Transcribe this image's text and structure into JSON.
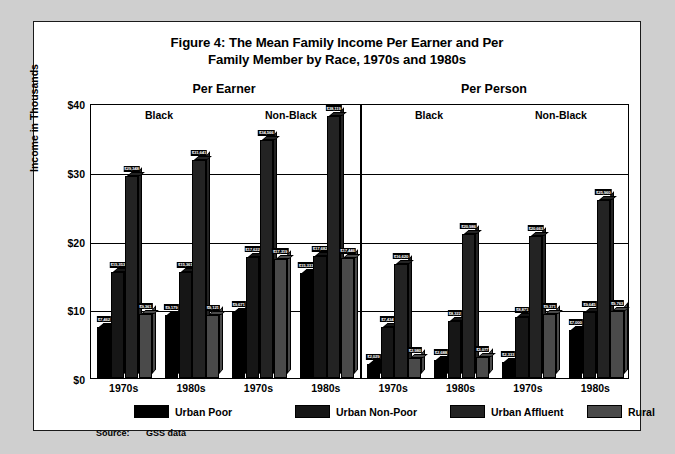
{
  "figure": {
    "title_line1": "Figure 4: The Mean Family Income Per Earner and Per",
    "title_line2": "Family Member by Race, 1970s and 1980s",
    "source_label": "Source:",
    "source_value": "GSS data"
  },
  "axes": {
    "y_title": "Income in Thousands",
    "y_ticks": [
      "$40",
      "$30",
      "$20",
      "$10",
      "$0"
    ]
  },
  "panels": {
    "per_earner": "Per Earner",
    "per_person": "Per Person",
    "black": "Black",
    "non_black": "Non-Black"
  },
  "legend": {
    "items": [
      {
        "label": "Urban Poor",
        "color": "#000000"
      },
      {
        "label": "Urban Non-Poor",
        "color": "#161616"
      },
      {
        "label": "Urban Affluent",
        "color": "#232323"
      },
      {
        "label": "Rural",
        "color": "#4a4a4a"
      }
    ]
  },
  "chart_data": {
    "type": "bar",
    "title": "Figure 4: The Mean Family Income Per Earner and Per Family Member by Race, 1970s and 1980s",
    "xlabel": "",
    "ylabel": "Income in Thousands",
    "ylim": [
      0,
      40
    ],
    "ytick_values": [
      0,
      10,
      20,
      30,
      40
    ],
    "grid": true,
    "legend_position": "bottom",
    "series_names": [
      "Urban Poor",
      "Urban Non-Poor",
      "Urban Affluent",
      "Rural"
    ],
    "groups": [
      {
        "panel": "Per Earner",
        "race": "Black",
        "decade": "1970s",
        "bars": [
          {
            "series": "Urban Poor",
            "value": 7462,
            "label": "$7,462"
          },
          {
            "series": "Urban Non-Poor",
            "value": 15353,
            "label": "$15,353"
          },
          {
            "series": "Urban Affluent",
            "value": 29348,
            "label": "$29,348"
          },
          {
            "series": "Rural",
            "value": 9361,
            "label": "$9,361"
          }
        ]
      },
      {
        "panel": "Per Earner",
        "race": "Black",
        "decade": "1980s",
        "bars": [
          {
            "series": "Urban Poor",
            "value": 9179,
            "label": "$9,179"
          },
          {
            "series": "Urban Non-Poor",
            "value": 15361,
            "label": "$15,361"
          },
          {
            "series": "Urban Affluent",
            "value": 31641,
            "label": "$31,641"
          },
          {
            "series": "Rural",
            "value": 9121,
            "label": "$9,121"
          }
        ]
      },
      {
        "panel": "Per Earner",
        "race": "Non-Black",
        "decade": "1970s",
        "bars": [
          {
            "series": "Urban Poor",
            "value": 9671,
            "label": "$9,671"
          },
          {
            "series": "Urban Non-Poor",
            "value": 17622,
            "label": "$17,622"
          },
          {
            "series": "Urban Affluent",
            "value": 34566,
            "label": "$34,566"
          },
          {
            "series": "Rural",
            "value": 17319,
            "label": "$17,319"
          }
        ]
      },
      {
        "panel": "Per Earner",
        "race": "Non-Black",
        "decade": "1980s",
        "bars": [
          {
            "series": "Urban Poor",
            "value": 15333,
            "label": "$15,333"
          },
          {
            "series": "Urban Non-Poor",
            "value": 17682,
            "label": "$17,682"
          },
          {
            "series": "Urban Affluent",
            "value": 38119,
            "label": "$38,119"
          },
          {
            "series": "Rural",
            "value": 17446,
            "label": "$17,446"
          }
        ]
      },
      {
        "panel": "Per Person",
        "race": "Black",
        "decade": "1970s",
        "bars": [
          {
            "series": "Urban Poor",
            "value": 2029,
            "label": "$2,029"
          },
          {
            "series": "Urban Non-Poor",
            "value": 7434,
            "label": "$7,434"
          },
          {
            "series": "Urban Affluent",
            "value": 16620,
            "label": "$16,620"
          },
          {
            "series": "Rural",
            "value": 2980,
            "label": "$2,980"
          }
        ]
      },
      {
        "panel": "Per Person",
        "race": "Black",
        "decade": "1980s",
        "bars": [
          {
            "series": "Urban Poor",
            "value": 2688,
            "label": "$2,688"
          },
          {
            "series": "Urban Non-Poor",
            "value": 8322,
            "label": "$8,322"
          },
          {
            "series": "Urban Affluent",
            "value": 20986,
            "label": "$20,986"
          },
          {
            "series": "Rural",
            "value": 3077,
            "label": "$3,077"
          }
        ]
      },
      {
        "panel": "Per Person",
        "race": "Non-Black",
        "decade": "1970s",
        "bars": [
          {
            "series": "Urban Poor",
            "value": 2333,
            "label": "$2,333"
          },
          {
            "series": "Urban Non-Poor",
            "value": 8871,
            "label": "$8,871"
          },
          {
            "series": "Urban Affluent",
            "value": 20663,
            "label": "$20,663"
          },
          {
            "series": "Rural",
            "value": 9371,
            "label": "$9,371"
          }
        ]
      },
      {
        "panel": "Per Person",
        "race": "Non-Black",
        "decade": "1980s",
        "bars": [
          {
            "series": "Urban Poor",
            "value": 7000,
            "label": "$7,000"
          },
          {
            "series": "Urban Non-Poor",
            "value": 9645,
            "label": "$9,645"
          },
          {
            "series": "Urban Affluent",
            "value": 25960,
            "label": "$25,960"
          },
          {
            "series": "Rural",
            "value": 9763,
            "label": "$9,763"
          }
        ]
      }
    ],
    "x_tick_labels": [
      "1970s",
      "1980s",
      "1970s",
      "1980s",
      "1970s",
      "1980s",
      "1970s",
      "1980s"
    ]
  }
}
